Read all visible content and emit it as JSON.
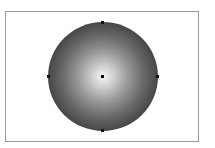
{
  "canvas": {
    "background": "#ffffff",
    "frame_border_color": "#9a9a9a"
  },
  "shape": {
    "type": "ellipse",
    "fill": "radial-gradient",
    "gradient_center_color": "#f4f4f4",
    "gradient_edge_color": "#262626",
    "handles": [
      "top",
      "right",
      "bottom",
      "left"
    ],
    "center_point": true
  }
}
